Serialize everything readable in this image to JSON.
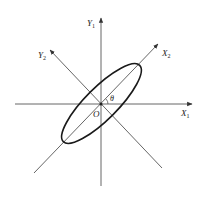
{
  "diagram": {
    "title": "",
    "colors": {
      "axis": "#555555",
      "ellipse": "#1a1a1a",
      "text": "#222222",
      "background": "#ffffff"
    },
    "origin": {
      "x": 101,
      "y": 104,
      "label": "O"
    },
    "angle_label": "θ",
    "axes": [
      {
        "id": "X1",
        "label": "X",
        "subscript": "1",
        "from": [
          15,
          104
        ],
        "to": [
          192,
          104
        ],
        "arrow": true
      },
      {
        "id": "Y1",
        "label": "Y",
        "subscript": "1",
        "from": [
          101,
          186
        ],
        "to": [
          101,
          18
        ],
        "arrow": true
      },
      {
        "id": "X2",
        "label": "X",
        "subscript": "2",
        "from": [
          34,
          173
        ],
        "to": [
          158,
          44
        ],
        "arrow": true
      },
      {
        "id": "Y2",
        "label": "Y",
        "subscript": "2",
        "from": [
          162,
          168
        ],
        "to": [
          50,
          50
        ],
        "arrow": true
      }
    ],
    "ellipse": {
      "cx": 101.5,
      "cy": 103.5,
      "rx": 54,
      "ry": 16,
      "rotation_deg": -45
    }
  }
}
